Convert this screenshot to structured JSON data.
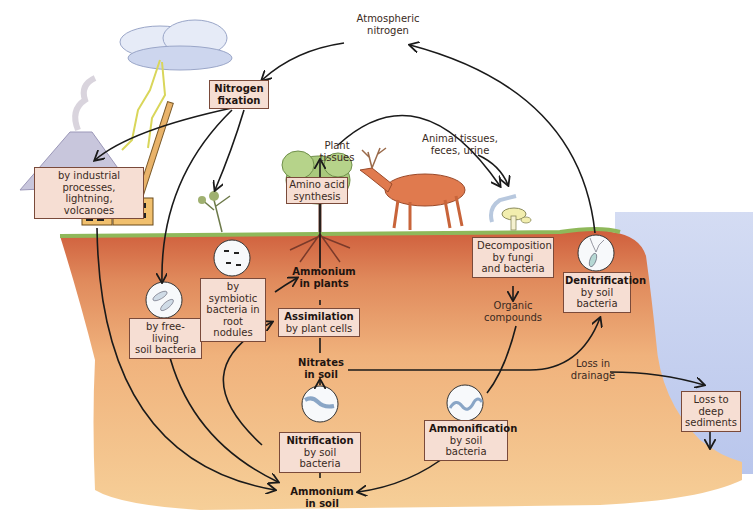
{
  "diagram": {
    "colors": {
      "sky": "#ffffff",
      "topsoil": "#d9704a",
      "subsoil": "#f3c48c",
      "water": "#c9d3ef",
      "grass": "#8fb85a",
      "label_box_fill": "#f6ded3",
      "label_box_border": "#7a4a3a",
      "arrow": "#1a1a1a"
    },
    "nodes": {
      "atmospheric_nitrogen": {
        "line1": "Atmospheric",
        "line2": "nitrogen"
      },
      "nitrogen_fixation": {
        "line1": "Nitrogen",
        "line2": "fixation"
      },
      "industrial": {
        "line1": "by industrial processes,",
        "line2": "lightning, volcanoes"
      },
      "free_living": {
        "line1": "by free-living",
        "line2": "soil bacteria"
      },
      "symbiotic": {
        "line1": "by symbiotic",
        "line2": "bacteria in",
        "line3": "root nodules"
      },
      "plant_tissues": {
        "line1": "Plant",
        "line2": "tissues"
      },
      "amino_acid": {
        "line1": "Amino acid",
        "line2": "synthesis"
      },
      "animal_tissues": {
        "line1": "Animal tissues,",
        "line2": "feces, urine"
      },
      "ammonium_plants": {
        "line1": "Ammonium",
        "line2": "in plants"
      },
      "assimilation": {
        "line1": "Assimilation",
        "line2": "by plant cells"
      },
      "nitrates_soil": {
        "line1": "Nitrates",
        "line2": "in soil"
      },
      "nitrification": {
        "line1": "Nitrification",
        "line2": "by soil bacteria"
      },
      "ammonium_soil": {
        "line1": "Ammonium",
        "line2": "in soil"
      },
      "decomposition": {
        "line1": "Decomposition",
        "line2": "by fungi",
        "line3": "and bacteria"
      },
      "organic_compounds": {
        "line1": "Organic",
        "line2": "compounds"
      },
      "ammonification": {
        "line1": "Ammonification",
        "line2": "by soil bacteria"
      },
      "denitrification": {
        "line1": "Denitrification",
        "line2": "by soil",
        "line3": "bacteria"
      },
      "loss_drainage": {
        "line1": "Loss in",
        "line2": "drainage"
      },
      "loss_sediments": {
        "line1": "Loss to",
        "line2": "deep",
        "line3": "sediments"
      }
    },
    "edges": [
      {
        "from": "Atmospheric nitrogen",
        "to": "Nitrogen fixation"
      },
      {
        "from": "Nitrogen fixation",
        "to": "by industrial processes, lightning, volcanoes"
      },
      {
        "from": "Nitrogen fixation",
        "to": "by free-living soil bacteria"
      },
      {
        "from": "Nitrogen fixation",
        "to": "by symbiotic bacteria in root nodules"
      },
      {
        "from": "by symbiotic bacteria in root nodules",
        "to": "Ammonium in plants"
      },
      {
        "from": "by industrial processes, lightning, volcanoes",
        "to": "Ammonium in soil"
      },
      {
        "from": "by free-living soil bacteria",
        "to": "Ammonium in soil"
      },
      {
        "from": "Ammonium in plants",
        "to": "Amino acid synthesis"
      },
      {
        "from": "Plant tissues",
        "to": "Decomposition by fungi and bacteria"
      },
      {
        "from": "Animal tissues, feces, urine",
        "to": "Decomposition by fungi and bacteria"
      },
      {
        "from": "Decomposition by fungi and bacteria",
        "to": "Organic compounds"
      },
      {
        "from": "Organic compounds",
        "to": "Ammonification by soil bacteria"
      },
      {
        "from": "Ammonification by soil bacteria",
        "to": "Ammonium in soil"
      },
      {
        "from": "Ammonium in soil",
        "to": "Nitrification by soil bacteria"
      },
      {
        "from": "Nitrification by soil bacteria",
        "to": "Nitrates in soil"
      },
      {
        "from": "Nitrates in soil",
        "to": "Assimilation by plant cells"
      },
      {
        "from": "Ammonium in soil",
        "to": "Assimilation by plant cells"
      },
      {
        "from": "Assimilation by plant cells",
        "to": "Ammonium in plants"
      },
      {
        "from": "Nitrates in soil",
        "to": "Denitrification by soil bacteria"
      },
      {
        "from": "Denitrification by soil bacteria",
        "to": "Atmospheric nitrogen"
      },
      {
        "from": "Nitrates in soil",
        "to": "Loss in drainage"
      },
      {
        "from": "Loss in drainage",
        "to": "Loss to deep sediments"
      }
    ]
  }
}
